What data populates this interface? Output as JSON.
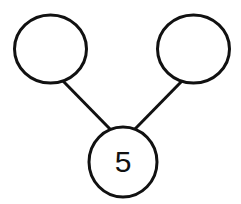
{
  "header": {
    "cut_off_text": ""
  },
  "number_bond": {
    "whole": "5",
    "parts": [
      "",
      ""
    ]
  },
  "colors": {
    "stroke": "#111111",
    "background": "#ffffff"
  }
}
